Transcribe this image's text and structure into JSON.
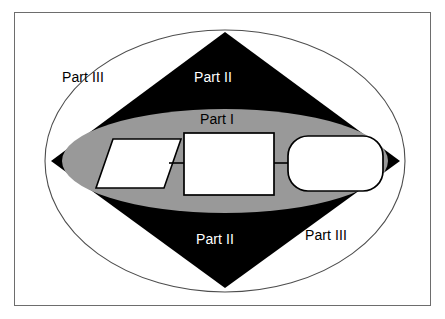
{
  "diagram": {
    "colors": {
      "frame_border": "#6d6d6d",
      "background": "#ffffff",
      "diamond_fill": "#000000",
      "ellipse_inner_fill": "#999999",
      "ellipse_outer_stroke": "#4d4d4d",
      "shape_fill": "#ffffff",
      "shape_stroke": "#000000",
      "arrow_color": "#000000"
    },
    "regions": [
      {
        "id": "part-iii-top",
        "label": "Part III",
        "text_color": "#000000",
        "zone": "outer-ellipse"
      },
      {
        "id": "part-ii-top",
        "label": "Part II",
        "text_color": "#ffffff",
        "zone": "diamond"
      },
      {
        "id": "part-i",
        "label": "Part I",
        "text_color": "#000000",
        "zone": "inner-ellipse"
      },
      {
        "id": "part-ii-bottom",
        "label": "Part II",
        "text_color": "#ffffff",
        "zone": "diamond"
      },
      {
        "id": "part-iii-bottom",
        "label": "Part III",
        "text_color": "#000000",
        "zone": "outer-ellipse"
      }
    ],
    "flow": {
      "nodes": [
        {
          "id": "input-node",
          "shape": "parallelogram",
          "label": ""
        },
        {
          "id": "process-node",
          "shape": "rectangle",
          "label": ""
        },
        {
          "id": "terminator-node",
          "shape": "rounded-rectangle",
          "label": ""
        }
      ],
      "connectors": [
        {
          "id": "arrow-1",
          "from": "input-node",
          "to": "process-node"
        },
        {
          "id": "arrow-2",
          "from": "process-node",
          "to": "terminator-node"
        }
      ]
    }
  }
}
